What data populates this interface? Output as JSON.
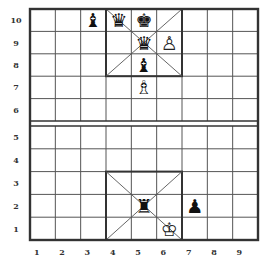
{
  "board": {
    "columns": 9,
    "rows": 10,
    "file_labels": [
      "1",
      "2",
      "3",
      "4",
      "5",
      "6",
      "7",
      "8",
      "9"
    ],
    "rank_labels": [
      "10",
      "9",
      "8",
      "7",
      "6",
      "5",
      "4",
      "3",
      "2",
      "1"
    ],
    "line_color": "#555555",
    "border_color": "#333333",
    "background": "#ffffff"
  },
  "pieces": [
    {
      "name": "black-bishop",
      "color": "black",
      "type": "bishop",
      "col": 3,
      "row": 10,
      "glyph": "♝"
    },
    {
      "name": "black-queen",
      "color": "black",
      "type": "queen",
      "col": 4,
      "row": 10,
      "glyph": "♛"
    },
    {
      "name": "black-king",
      "color": "black",
      "type": "king",
      "col": 5,
      "row": 10,
      "glyph": "♚"
    },
    {
      "name": "black-queen",
      "color": "black",
      "type": "queen",
      "col": 5,
      "row": 9,
      "glyph": "♛"
    },
    {
      "name": "white-pawn",
      "color": "white",
      "type": "pawn",
      "col": 6,
      "row": 9,
      "glyph": "♙"
    },
    {
      "name": "black-bishop",
      "color": "black",
      "type": "bishop",
      "col": 5,
      "row": 8,
      "glyph": "♝"
    },
    {
      "name": "white-bishop",
      "color": "white",
      "type": "bishop",
      "col": 5,
      "row": 7,
      "glyph": "♗"
    },
    {
      "name": "black-rook",
      "color": "black",
      "type": "rook",
      "col": 5,
      "row": 2,
      "glyph": "♜"
    },
    {
      "name": "black-pawn",
      "color": "black",
      "type": "pawn",
      "col": 7,
      "row": 2,
      "glyph": "♟"
    },
    {
      "name": "white-king",
      "color": "white",
      "type": "king",
      "col": 6,
      "row": 1,
      "glyph": "♔"
    }
  ],
  "palaces": [
    {
      "name": "top-palace",
      "col_from": 4,
      "col_to": 6,
      "row_from": 8,
      "row_to": 10
    },
    {
      "name": "bottom-palace",
      "col_from": 4,
      "col_to": 6,
      "row_from": 1,
      "row_to": 3
    }
  ]
}
